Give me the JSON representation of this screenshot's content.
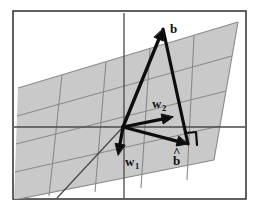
{
  "figure": {
    "canvas": {
      "width": 262,
      "height": 215
    },
    "background_color": "#ffffff",
    "frame": {
      "x": 13,
      "y": 11,
      "width": 233,
      "height": 188,
      "stroke": "#3a3a3a",
      "stroke_width": 1.6,
      "fill": "#ffffff"
    },
    "plane": {
      "fill": "#c9c9c9",
      "grid_stroke": "#8a8a8a",
      "grid_stroke_width": 1.1,
      "corners": [
        {
          "x": 18,
          "y": 88
        },
        {
          "x": 238,
          "y": 22
        },
        {
          "x": 214,
          "y": 160
        },
        {
          "x": 14,
          "y": 200
        }
      ]
    },
    "axes": {
      "stroke": "#4a4a4a",
      "stroke_width": 1.3,
      "vertical": {
        "x1": 124,
        "y1": 13,
        "x2": 124,
        "y2": 198
      },
      "horizontal": {
        "x1": 14,
        "y1": 127,
        "x2": 245,
        "y2": 127
      },
      "depth": {
        "x1": 123,
        "y1": 127,
        "x2": 57,
        "y2": 198
      }
    },
    "origin": {
      "x": 123,
      "y": 127
    },
    "vector_stroke": "#0d0d0d",
    "vectors": [
      {
        "id": "b",
        "label": "b",
        "subscript": "",
        "hat": false,
        "from": {
          "x": 123,
          "y": 127
        },
        "to": {
          "x": 163,
          "y": 29
        },
        "stroke_width": 3.4,
        "label_pos": {
          "x": 170,
          "y": 33
        }
      },
      {
        "id": "w2",
        "label": "w",
        "subscript": "2",
        "hat": false,
        "from": {
          "x": 123,
          "y": 127
        },
        "to": {
          "x": 173,
          "y": 117
        },
        "stroke_width": 3.2,
        "label_pos": {
          "x": 152,
          "y": 108
        }
      },
      {
        "id": "w1",
        "label": "w",
        "subscript": "1",
        "hat": false,
        "from": {
          "x": 123,
          "y": 127
        },
        "to": {
          "x": 118,
          "y": 155
        },
        "stroke_width": 3.2,
        "label_pos": {
          "x": 125,
          "y": 166
        }
      },
      {
        "id": "bhat",
        "label": "b",
        "subscript": "",
        "hat": true,
        "from": {
          "x": 123,
          "y": 127
        },
        "to": {
          "x": 188,
          "y": 144
        },
        "stroke_width": 3.2,
        "label_pos": {
          "x": 173,
          "y": 165
        }
      },
      {
        "id": "residual",
        "label": "",
        "subscript": "",
        "hat": false,
        "from": {
          "x": 163,
          "y": 29
        },
        "to": {
          "x": 188,
          "y": 144
        },
        "stroke_width": 3.2,
        "label_pos": null
      }
    ],
    "right_angle_marker": {
      "description": "right-angle symbol at tip of b-hat indicating orthogonality",
      "points": "186,133 196,132 197,145",
      "stroke": "#0d0d0d",
      "stroke_width": 2.2
    },
    "labels": {
      "b": "b",
      "b_hat": "b",
      "w1_base": "w",
      "w1_sub": "1",
      "w2_base": "w",
      "w2_sub": "2",
      "hat_glyph": "^"
    }
  }
}
